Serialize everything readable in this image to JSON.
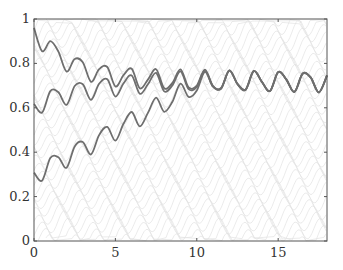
{
  "chart_data": {
    "type": "line",
    "title": "",
    "xlabel": "",
    "ylabel": "",
    "xlim": [
      0,
      18
    ],
    "ylim": [
      0,
      1
    ],
    "grid": false,
    "legend": null,
    "x_ticks": [
      0,
      5,
      10,
      15
    ],
    "x_tick_labels": [
      "0",
      "5",
      "10",
      "15"
    ],
    "y_ticks": [
      0,
      0.2,
      0.4,
      0.6,
      0.8,
      1
    ],
    "y_tick_labels": [
      "0",
      "0.2",
      "0.4",
      "0.6",
      "0.8",
      "1"
    ],
    "x": [
      0,
      0.5,
      1,
      1.5,
      2,
      2.5,
      3,
      3.5,
      4,
      4.5,
      5,
      5.5,
      6,
      6.5,
      7,
      7.5,
      8,
      8.5,
      9,
      9.5,
      10,
      10.5,
      11,
      11.5,
      12,
      12.5,
      13,
      13.5,
      14,
      14.5,
      15,
      15.5,
      16,
      16.5,
      17,
      17.5,
      18
    ],
    "series": [
      {
        "name": "trajectory-high-start",
        "values": [
          0.96,
          0.855,
          0.9,
          0.853,
          0.763,
          0.82,
          0.805,
          0.717,
          0.774,
          0.784,
          0.696,
          0.747,
          0.776,
          0.688,
          0.727,
          0.774,
          0.688,
          0.712,
          0.773,
          0.692,
          0.7,
          0.772,
          0.698,
          0.689,
          0.769,
          0.708,
          0.682,
          0.766,
          0.717,
          0.676,
          0.761,
          0.728,
          0.672,
          0.754,
          0.737,
          0.67,
          0.746
        ]
      },
      {
        "name": "trajectory-mid-start",
        "values": [
          0.618,
          0.579,
          0.675,
          0.67,
          0.613,
          0.698,
          0.706,
          0.636,
          0.708,
          0.729,
          0.651,
          0.71,
          0.746,
          0.663,
          0.706,
          0.757,
          0.674,
          0.701,
          0.764,
          0.684,
          0.694,
          0.767,
          0.695,
          0.687,
          0.767,
          0.706,
          0.68,
          0.765,
          0.716,
          0.675,
          0.76,
          0.727,
          0.671,
          0.753,
          0.736,
          0.669,
          0.745
        ]
      },
      {
        "name": "trajectory-low-start",
        "values": [
          0.308,
          0.272,
          0.374,
          0.377,
          0.33,
          0.426,
          0.446,
          0.39,
          0.477,
          0.514,
          0.452,
          0.528,
          0.581,
          0.516,
          0.577,
          0.646,
          0.582,
          0.627,
          0.709,
          0.649,
          0.678,
          0.762,
          0.695,
          0.688,
          0.769,
          0.708,
          0.682,
          0.766,
          0.717,
          0.676,
          0.761,
          0.728,
          0.672,
          0.754,
          0.737,
          0.67,
          0.746
        ]
      }
    ],
    "background_texture": "faint gray wavy trajectory field",
    "colors": {
      "series_line": "#6e6e6e",
      "axis": "#555555",
      "background_lines": "#e2e2e2"
    }
  }
}
